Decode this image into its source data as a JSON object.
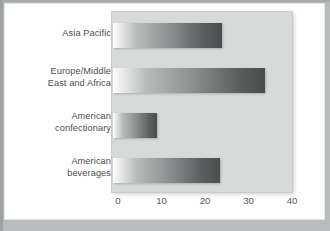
{
  "figure": {
    "background_color": "#fefefe",
    "page_color": "#b8bbbb",
    "plot_panel_color": "#d8dada"
  },
  "chart_data": {
    "type": "bar",
    "orientation": "horizontal",
    "title": "",
    "subtitle": "",
    "xlabel": "",
    "ylabel": "",
    "categories": [
      "Asia Pacific",
      "Europe/Middle\nEast and Africa",
      "American\nconfectionary",
      "American\nbeverages"
    ],
    "values": [
      25,
      35,
      10,
      24.5
    ],
    "xlim": [
      0,
      40
    ],
    "xticks": [
      0,
      10,
      20,
      30,
      40
    ],
    "xtick_labels": [
      "0",
      "10",
      "20",
      "30",
      "40"
    ],
    "grid": false,
    "legend": null,
    "bar_style": "grayscale-gradient-left-to-right",
    "bar_colors": {
      "gradient_start": "#fdfdfd",
      "gradient_end": "#4a4c4d"
    },
    "annotations": []
  }
}
